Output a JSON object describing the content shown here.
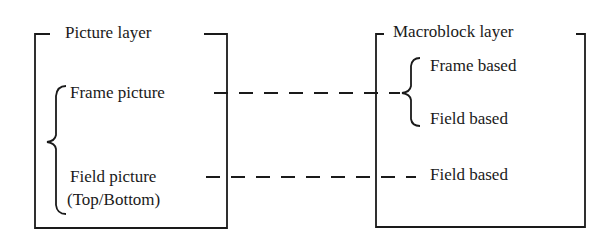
{
  "picture_layer": {
    "title": "Picture layer",
    "items": [
      {
        "label": "Frame picture"
      },
      {
        "label": "Field picture"
      },
      {
        "label": "(Top/Bottom)"
      }
    ]
  },
  "macroblock_layer": {
    "title": "Macroblock layer",
    "items": [
      {
        "label": "Frame based"
      },
      {
        "label": "Field based"
      },
      {
        "label": "Field based"
      }
    ]
  },
  "connections": [
    {
      "from": "Frame picture",
      "to": [
        "Frame based",
        "Field based"
      ]
    },
    {
      "from": "Field picture",
      "to": [
        "Field based"
      ]
    }
  ]
}
